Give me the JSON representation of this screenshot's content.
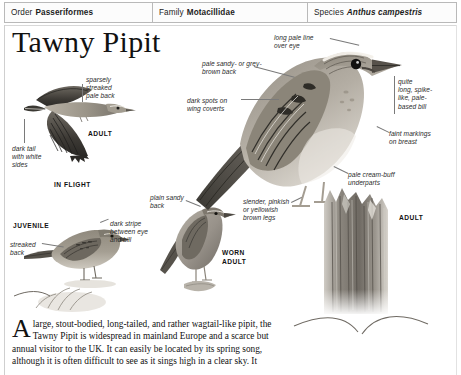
{
  "taxonomy": {
    "order_label": "Order",
    "order_value": "Passeriformes",
    "family_label": "Family",
    "family_value": "Motacillidae",
    "species_label": "Species",
    "species_value": "Anthus campestris"
  },
  "title": "Tawny Pipit",
  "annotations": {
    "sparsely_streaked_pale_back": "sparsely\nstreaked\npale back",
    "dark_tail_white_sides": "dark tail\nwith white\nsides",
    "streaked_back": "streaked\nback",
    "dark_stripe_eye_bill": "dark stripe\nbetween eye\nand bill",
    "plain_sandy_back": "plain sandy\nback",
    "long_pale_line_over_eye": "long pale line\nover eye",
    "pale_sandy_grey_brown_back": "pale sandy- or grey-\nbrown back",
    "dark_spots_wing_coverts": "dark spots on\nwing coverts",
    "quite_long_bill": "quite\nlong, spike-\nlike, pale-\nbased bill",
    "faint_markings_breast": "faint markings\non breast",
    "pale_cream_buff_underparts": "pale cream-buff\nunderparts",
    "slender_legs": "slender, pinkish\nor yellowish\nbrown legs"
  },
  "captions": {
    "adult_flight_top": "ADULT",
    "in_flight": "IN FLIGHT",
    "juvenile": "JUVENILE",
    "worn_adult": "WORN\nADULT",
    "adult_right": "ADULT"
  },
  "body": {
    "dropcap": "A",
    "paragraph": "large, stout-bodied, long-tailed, and rather wagtail-like pipit, the Tawny Pipit is widespread in mainland Europe and a scarce but annual visitor to the UK. It can easily be located by its spring song, although it is often difficult to see as it sings high in a clear sky. It"
  },
  "colors": {
    "border": "#b9b9b9",
    "leader": "#7a7a7a",
    "text": "#111111",
    "bird_dark": "#4a4742",
    "bird_mid": "#8d887e",
    "bird_light": "#c9c3b8"
  }
}
